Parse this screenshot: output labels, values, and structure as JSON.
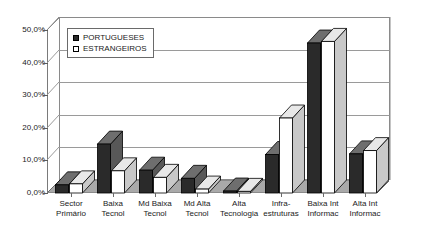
{
  "chart_data": {
    "type": "bar",
    "title": "",
    "xlabel": "",
    "ylabel": "",
    "ylim": [
      0,
      50
    ],
    "yticks": [
      0,
      10,
      20,
      30,
      40,
      50
    ],
    "ytick_labels": [
      "0,0%",
      "10,0%",
      "20,0%",
      "30,0%",
      "40,0%",
      "50,0%"
    ],
    "grid": true,
    "legend_position": "upper-left-inside",
    "categories": [
      "Sector Primário",
      "Baixa Tecnol",
      "Md Baixa Tecnol",
      "Md Alta Tecnol",
      "Alta Tecnologia",
      "Infra-estruturas",
      "Baixa Int Informac",
      "Alta Int Informac"
    ],
    "category_lines": [
      [
        "Sector",
        "Primário"
      ],
      [
        "Baixa",
        "Tecnol"
      ],
      [
        "Md Baixa",
        "Tecnol"
      ],
      [
        "Md Alta",
        "Tecnol"
      ],
      [
        "Alta",
        "Tecnologia"
      ],
      [
        "Infra-",
        "estruturas"
      ],
      [
        "Baixa Int",
        "Informac"
      ],
      [
        "Alta Int",
        "Informac"
      ]
    ],
    "series": [
      {
        "name": "PORTUGUESES",
        "color": "#2a2a2a",
        "values": [
          2.5,
          15.0,
          7.0,
          4.5,
          0.6,
          11.8,
          46.0,
          12.0
        ]
      },
      {
        "name": "ESTRANGEIROS",
        "color": "#ffffff",
        "values": [
          2.8,
          6.8,
          4.8,
          1.2,
          0.5,
          23.0,
          46.5,
          13.0
        ]
      }
    ]
  },
  "legend": {
    "items": [
      {
        "label": "PORTUGUESES",
        "style": "filled"
      },
      {
        "label": "ESTRANGEIROS",
        "style": "open"
      }
    ]
  },
  "axes": {
    "y_tick_labels": [
      "50,0%",
      "40,0%",
      "30,0%",
      "20,0%",
      "10,0%",
      "0,0%"
    ]
  },
  "title_strip": {
    "text": ""
  }
}
